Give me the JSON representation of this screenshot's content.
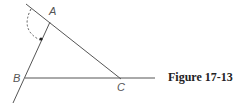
{
  "figure": {
    "caption": "Figure 17-13",
    "points": {
      "A": {
        "label": "A",
        "x": 49,
        "y": 22
      },
      "B": {
        "label": "B",
        "x": 24,
        "y": 78
      },
      "C": {
        "label": "C",
        "x": 120,
        "y": 78
      }
    },
    "lines": [
      {
        "name": "line-through-A-and-C",
        "from": [
          26,
          4
        ],
        "to": [
          120,
          78
        ]
      },
      {
        "name": "line-through-B-and-A",
        "from": [
          13,
          103
        ],
        "to": [
          49,
          22
        ]
      },
      {
        "name": "segment-B-to-C",
        "from": [
          24,
          78
        ],
        "to": [
          155,
          78
        ]
      }
    ],
    "arc": {
      "description": "dashed arc with arrow from line near A to line BA"
    },
    "colors": {
      "line": "#555555",
      "label": "#555555"
    }
  }
}
